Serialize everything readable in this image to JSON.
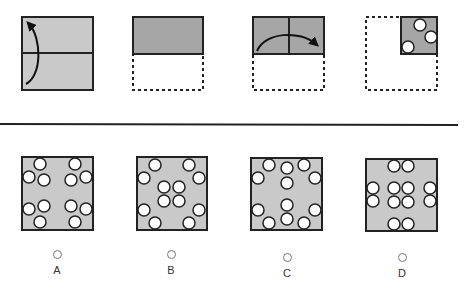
{
  "puzzle": {
    "type": "paper-folding-hole-punch",
    "steps": [
      {
        "id": "step-1",
        "description": "full square, fold bottom half up",
        "fold": "bottom-to-top"
      },
      {
        "id": "step-2",
        "description": "folded to top half"
      },
      {
        "id": "step-3",
        "description": "fold left half over to right",
        "fold": "left-to-right"
      },
      {
        "id": "step-4",
        "description": "folded to top-right quarter with 3 holes punched",
        "holes": 3
      }
    ],
    "colors": {
      "paper_light": "#c9c9c9",
      "paper_dark": "#a6a6a6",
      "outline": "#222222",
      "hole": "#ffffff"
    }
  },
  "options": [
    {
      "id": "A",
      "label": "A",
      "hole_count": 12
    },
    {
      "id": "B",
      "label": "B",
      "hole_count": 12
    },
    {
      "id": "C",
      "label": "C",
      "hole_count": 12
    },
    {
      "id": "D",
      "label": "D",
      "hole_count": 12
    }
  ]
}
